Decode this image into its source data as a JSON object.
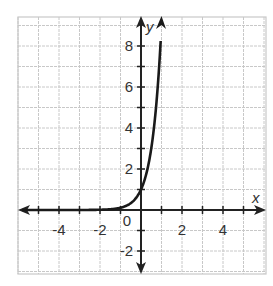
{
  "chart_data": {
    "type": "line",
    "title": "",
    "xlabel": "x",
    "ylabel": "y",
    "xlim": [
      -6,
      6
    ],
    "ylim": [
      -3,
      9
    ],
    "grid": true,
    "x_ticks": [
      -4,
      -2,
      0,
      2,
      4
    ],
    "y_ticks": [
      -2,
      2,
      4,
      6,
      8
    ],
    "x_tick_labels": [
      "-4",
      "-2",
      "0",
      "2",
      "4"
    ],
    "y_tick_labels": [
      "-2",
      "2",
      "4",
      "6",
      "8"
    ],
    "origin_label": "0",
    "series": [
      {
        "name": "exponential curve",
        "function": "y = 9^x",
        "points": [
          {
            "x": -3,
            "y": 0.001
          },
          {
            "x": -2,
            "y": 0.012
          },
          {
            "x": -1,
            "y": 0.11
          },
          {
            "x": -0.5,
            "y": 0.33
          },
          {
            "x": 0,
            "y": 1
          },
          {
            "x": 0.25,
            "y": 1.73
          },
          {
            "x": 0.5,
            "y": 3
          },
          {
            "x": 0.75,
            "y": 5.2
          },
          {
            "x": 1,
            "y": 9
          }
        ]
      }
    ],
    "colors": {
      "grid": "#c8c8c8",
      "axis": "#222222",
      "curve": "#1a1a1a"
    }
  }
}
